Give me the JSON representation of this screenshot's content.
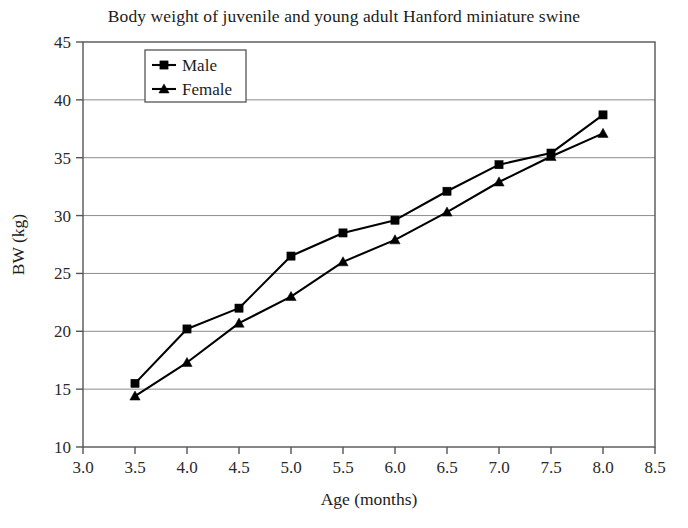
{
  "chart_data": {
    "type": "line",
    "title": "Body weight of juvenile and young adult Hanford miniature swine",
    "xlabel": "Age (months)",
    "ylabel": "BW (kg)",
    "xlim": [
      3.0,
      8.5
    ],
    "ylim": [
      10,
      45
    ],
    "xticks": [
      "3.0",
      "3.5",
      "4.0",
      "4.5",
      "5.0",
      "5.5",
      "6.0",
      "6.5",
      "7.0",
      "7.5",
      "8.0",
      "8.5"
    ],
    "yticks": [
      "10",
      "15",
      "20",
      "25",
      "30",
      "35",
      "40",
      "45"
    ],
    "grid": "horizontal",
    "legend_position": "top-left-inside",
    "x": [
      3.5,
      4.0,
      4.5,
      5.0,
      5.5,
      6.0,
      6.5,
      7.0,
      7.5,
      8.0
    ],
    "series": [
      {
        "name": "Male",
        "marker": "square",
        "color": "#000000",
        "values": [
          15.5,
          20.2,
          22.0,
          26.5,
          28.5,
          29.6,
          32.1,
          34.4,
          35.4,
          38.7
        ]
      },
      {
        "name": "Female",
        "marker": "triangle",
        "color": "#000000",
        "values": [
          14.4,
          17.3,
          20.7,
          23.0,
          26.0,
          27.9,
          30.3,
          32.9,
          35.1,
          37.1
        ]
      }
    ]
  },
  "legend": {
    "entries": [
      {
        "label": "Male"
      },
      {
        "label": "Female"
      }
    ]
  },
  "icons": {
    "square_marker": "square-marker-icon",
    "triangle_marker": "triangle-marker-icon"
  }
}
